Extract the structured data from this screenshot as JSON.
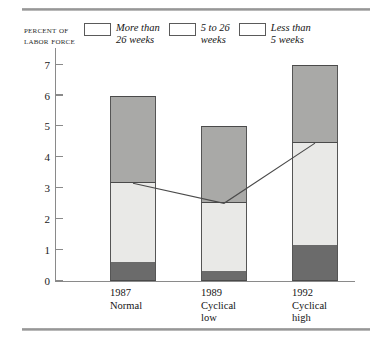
{
  "chart_data": {
    "type": "bar",
    "title": "",
    "subtitle": "",
    "stacked": true,
    "ylabel": "Percent of labor force",
    "xlabel": "",
    "ylim": [
      0,
      7
    ],
    "ytick_labels": [
      "0",
      "1",
      "2",
      "3",
      "4",
      "5",
      "6",
      "7"
    ],
    "ytick_values": [
      0,
      1,
      2,
      3,
      4,
      5,
      6,
      7
    ],
    "grid": false,
    "legend_position": "top",
    "categories": [
      "1987",
      "1989",
      "1992"
    ],
    "category_sublabels": [
      "Normal",
      "Cyclical\nlow",
      "Cyclical\nhigh"
    ],
    "series": [
      {
        "name": "More than\n26 weeks",
        "legend_label": "More than\n26 weeks",
        "color": "#6b6b6b",
        "values": [
          0.6,
          0.3,
          1.15
        ]
      },
      {
        "name": "5 to 26\nweeks",
        "legend_label": "5 to 26\nweeks",
        "color": "#e9e9e7",
        "values": [
          2.6,
          2.25,
          3.35
        ]
      },
      {
        "name": "Less than\n5 weeks",
        "legend_label": "Less than\n5 weeks",
        "color": "#a9a9a7",
        "values": [
          2.8,
          2.45,
          2.5
        ]
      }
    ],
    "bar_totals": [
      6.0,
      5.0,
      7.0
    ],
    "annotation_line": {
      "description": "line connecting the top of the 5-to-26-weeks segment of each bar",
      "values": [
        3.2,
        2.55,
        4.5
      ],
      "color": "#4a4a4a"
    }
  },
  "axis_title": {
    "line1": "Percent of",
    "line2": "labor force"
  }
}
